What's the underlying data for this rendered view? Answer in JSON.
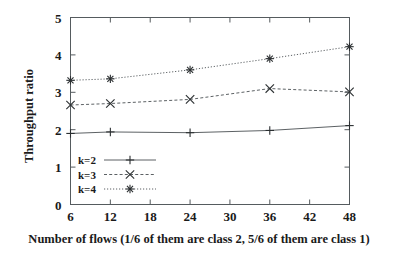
{
  "chart_data": {
    "type": "line",
    "title": "",
    "xlabel": "Number of flows (1/6 of them are class 2, 5/6 of them are class 1)",
    "ylabel": "Throughput ratio",
    "xlim": [
      6,
      48
    ],
    "ylim": [
      0,
      5
    ],
    "xticks": [
      6,
      12,
      18,
      24,
      30,
      36,
      42,
      48
    ],
    "yticks": [
      0,
      1,
      2,
      3,
      4,
      5
    ],
    "xtick_labels": [
      "6",
      "12",
      "18",
      "24",
      "30",
      "36",
      "42",
      "48"
    ],
    "ytick_labels": [
      "0",
      "1",
      "2",
      "3",
      "4",
      "5"
    ],
    "grid": false,
    "legend_position": "lower-left inside plot",
    "x": [
      6,
      12,
      24,
      36,
      48
    ],
    "series": [
      {
        "name": "k=2",
        "label": "k=2",
        "marker": "plus",
        "linestyle": "solid",
        "color": "#4a4f52",
        "values": [
          1.9,
          1.94,
          1.92,
          1.98,
          2.11
        ]
      },
      {
        "name": "k=3",
        "label": "k=3",
        "marker": "cross",
        "linestyle": "dashed",
        "color": "#4a4f52",
        "values": [
          2.66,
          2.7,
          2.81,
          3.1,
          3.01
        ]
      },
      {
        "name": "k=4",
        "label": "k=4",
        "marker": "asterisk",
        "linestyle": "dotted",
        "color": "#4a4f52",
        "values": [
          3.32,
          3.36,
          3.6,
          3.9,
          4.22
        ]
      }
    ]
  },
  "axes": {
    "ylabel": "Throughput ratio",
    "xlabel": "Number of flows (1/6 of them are class 2, 5/6 of them are class 1)"
  },
  "legend": {
    "entries": [
      {
        "label": "k=2"
      },
      {
        "label": "k=3"
      },
      {
        "label": "k=4"
      }
    ]
  }
}
